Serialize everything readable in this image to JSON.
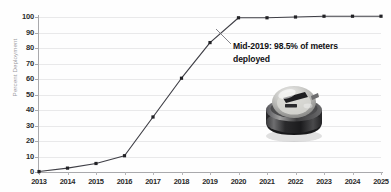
{
  "chart_data": {
    "type": "line",
    "title": "",
    "subtitle": "",
    "xlabel": "",
    "ylabel": "Percent Deployment",
    "categories": [
      "2013",
      "2014",
      "2015",
      "2016",
      "2017",
      "2018",
      "2019",
      "2020",
      "2021",
      "2022",
      "2023",
      "2024",
      "2025"
    ],
    "values": [
      0.3,
      2.5,
      5.5,
      10.5,
      35.5,
      60.5,
      83.5,
      99.5,
      99.5,
      100,
      100.5,
      100.5,
      100.5
    ],
    "series": [
      {
        "name": "Percent Deployment",
        "values": [
          0.3,
          2.5,
          5.5,
          10.5,
          35.5,
          60.5,
          83.5,
          99.5,
          99.5,
          100,
          100.5,
          100.5,
          100.5
        ]
      }
    ],
    "ylim": [
      0,
      100
    ],
    "yticks": [
      0,
      10,
      20,
      30,
      40,
      50,
      60,
      70,
      80,
      90,
      100
    ],
    "ytick_labels": [
      "0",
      "10",
      "20",
      "30",
      "40",
      "50",
      "60",
      "70",
      "80",
      "90",
      "100"
    ],
    "xlim": [
      "2013",
      "2025"
    ],
    "grid": "horizontal",
    "legend": "none",
    "marker": "square",
    "line_color": "#3f3f46",
    "marker_color": "#222226",
    "grid_color": "#e9e9ea",
    "axis_color": "#a9a9ac",
    "background": "#ffffff",
    "annotations": [
      {
        "text_line1": "Mid-2019: 98.5% of meters",
        "text_line2": "deployed",
        "full_text": "Mid-2019: 98.5% of meters deployed",
        "points_to_category": "2020",
        "points_to_value": 95
      }
    ],
    "images": [
      {
        "name": "electric-utility-meter-photo",
        "description": "Photograph of a round electric utility smart meter with glass dome"
      }
    ]
  },
  "axis": {
    "y_label": "Percent Deployment"
  }
}
